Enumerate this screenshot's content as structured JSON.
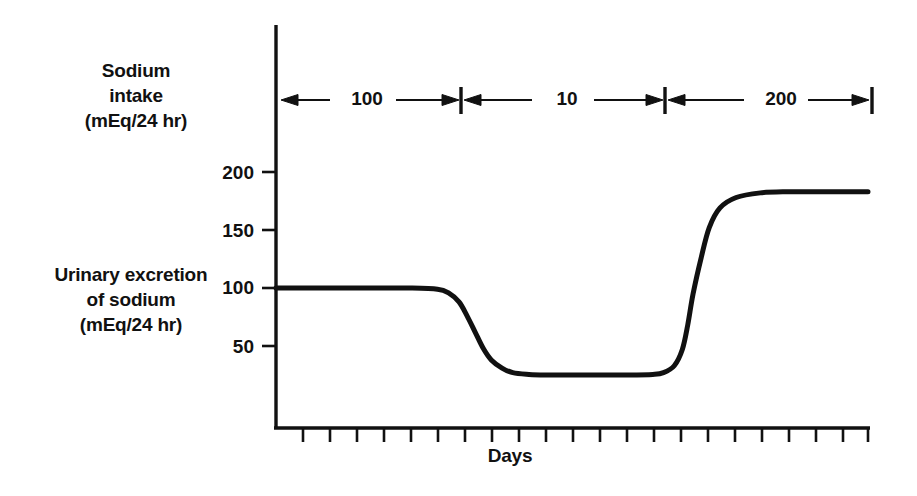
{
  "figure": {
    "background_color": "#ffffff",
    "ink_color": "#111111"
  },
  "axes": {
    "y_axis_label_lines": [
      "Urinary excretion",
      "of sodium",
      "(mEq/24 hr)"
    ],
    "y_axis_label": "Urinary excretion of sodium (mEq/24 hr)",
    "x_axis_label": "Days",
    "y_ticks": [
      "50",
      "100",
      "150",
      "200"
    ],
    "y_tick_values": [
      50,
      100,
      150,
      200
    ],
    "x_tick_count": 22
  },
  "intake_annotation": {
    "label_lines": [
      "Sodium",
      "intake",
      "(mEq/24 hr)"
    ],
    "label": "Sodium intake (mEq/24 hr)",
    "phases": [
      {
        "value": "100",
        "numeric": 100
      },
      {
        "value": "10",
        "numeric": 10
      },
      {
        "value": "200",
        "numeric": 200
      }
    ]
  },
  "chart_data": {
    "type": "line",
    "title": "",
    "subtitle": "",
    "xlabel": "Days",
    "ylabel": "Urinary excretion of sodium (mEq/24 hr)",
    "xlim": [
      0,
      22
    ],
    "ylim": [
      0,
      215
    ],
    "yticks": [
      50,
      100,
      150,
      200
    ],
    "ytick_labels": [
      "50",
      "100",
      "150",
      "200"
    ],
    "xticks_labeled": false,
    "grid": false,
    "legend": false,
    "series": [
      {
        "name": "Urinary sodium excretion",
        "color": "#111111",
        "x": [
          0,
          1,
          2,
          3,
          4,
          5,
          6,
          6.4,
          6.8,
          7.1,
          7.4,
          7.7,
          8.0,
          8.4,
          8.8,
          9.4,
          10,
          11,
          12,
          13,
          14,
          14.4,
          14.8,
          15.1,
          15.3,
          15.5,
          15.8,
          16.1,
          16.5,
          17.1,
          18,
          19,
          20,
          21,
          22
        ],
        "y": [
          100,
          100,
          100,
          100,
          100,
          100,
          99,
          96,
          88,
          76,
          62,
          48,
          38,
          31,
          27,
          25.5,
          25,
          25,
          25,
          25,
          25.5,
          27,
          33,
          47,
          68,
          95,
          126,
          152,
          169,
          178,
          182,
          183,
          183,
          183,
          183
        ]
      }
    ],
    "annotations": [
      {
        "kind": "phase-span",
        "label": "100",
        "start_x": 0,
        "end_x": 6.6,
        "description": "Sodium intake 100 mEq/24 hr"
      },
      {
        "kind": "phase-span",
        "label": "10",
        "start_x": 6.6,
        "end_x": 14.6,
        "description": "Sodium intake 10 mEq/24 hr"
      },
      {
        "kind": "phase-span",
        "label": "200",
        "start_x": 14.6,
        "end_x": 22,
        "description": "Sodium intake 200 mEq/24 hr"
      }
    ],
    "plateau_levels": {
      "baseline": 100,
      "low_sodium": 25,
      "high_sodium": 183
    }
  }
}
